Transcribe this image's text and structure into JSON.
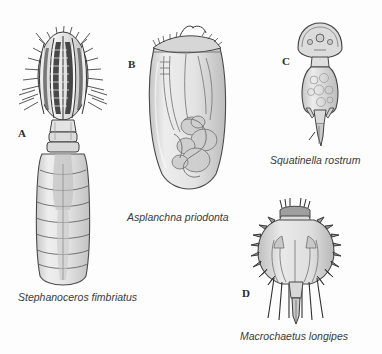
{
  "plate": {
    "background_color": "#fdfdfd",
    "ink_color": "#3a3a3a",
    "fill_light": "#e2e2e2",
    "fill_mid": "#cfcfcf",
    "fill_dark": "#b3b3b3",
    "width": 382,
    "height": 354
  },
  "figures": [
    {
      "letter": "A",
      "caption": "Stephanoceros fimbriatus",
      "letter_x": 18,
      "letter_y": 128,
      "caption_x": 18,
      "caption_y": 292
    },
    {
      "letter": "B",
      "caption": "Asplanchna priodonta",
      "letter_x": 128,
      "letter_y": 59,
      "caption_x": 127,
      "caption_y": 212
    },
    {
      "letter": "C",
      "caption": "Squatinella rostrum",
      "letter_x": 282,
      "letter_y": 56,
      "caption_x": 270,
      "caption_y": 155
    },
    {
      "letter": "D",
      "caption": "Macrochaetus longipes",
      "letter_x": 242,
      "letter_y": 288,
      "caption_x": 240,
      "caption_y": 331
    }
  ]
}
